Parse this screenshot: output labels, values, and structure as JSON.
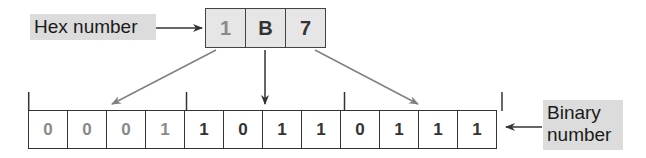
{
  "labels": {
    "hex": "Hex number",
    "binary_line1": "Binary",
    "binary_line2": "number"
  },
  "hex_digits": [
    {
      "value": "1",
      "color": "#8a8a8a"
    },
    {
      "value": "B",
      "color": "#333333"
    },
    {
      "value": "7",
      "color": "#333333"
    }
  ],
  "binary_digits": [
    {
      "value": "0",
      "color": "#8a8a8a"
    },
    {
      "value": "0",
      "color": "#8a8a8a"
    },
    {
      "value": "0",
      "color": "#8a8a8a"
    },
    {
      "value": "1",
      "color": "#8a8a8a"
    },
    {
      "value": "1",
      "color": "#333333"
    },
    {
      "value": "0",
      "color": "#333333"
    },
    {
      "value": "1",
      "color": "#333333"
    },
    {
      "value": "1",
      "color": "#333333"
    },
    {
      "value": "0",
      "color": "#333333"
    },
    {
      "value": "1",
      "color": "#333333"
    },
    {
      "value": "1",
      "color": "#333333"
    },
    {
      "value": "1",
      "color": "#333333"
    }
  ],
  "colors": {
    "label_bg": "#dcdcdc",
    "hex_bg": "#e6e6e6",
    "arrow_gray": "#808080",
    "arrow_dark": "#333333"
  }
}
